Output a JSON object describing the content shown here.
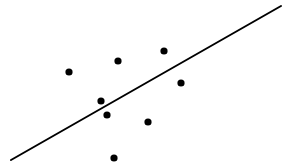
{
  "chart_data": {
    "type": "scatter",
    "title": "",
    "xlabel": "",
    "ylabel": "",
    "xlim": [
      0,
      293
    ],
    "ylim": [
      0,
      167
    ],
    "grid": false,
    "axes_visible": false,
    "legend": "none",
    "series": [
      {
        "name": "points",
        "color": "#000000",
        "points": [
          {
            "x": 69,
            "y": 95
          },
          {
            "x": 118,
            "y": 106
          },
          {
            "x": 164,
            "y": 116
          },
          {
            "x": 181,
            "y": 84
          },
          {
            "x": 101,
            "y": 66
          },
          {
            "x": 107,
            "y": 52
          },
          {
            "x": 148,
            "y": 45
          },
          {
            "x": 114,
            "y": 9
          }
        ]
      }
    ],
    "fit_line": {
      "name": "regression-line",
      "color": "#000000",
      "from": {
        "x": 11,
        "y": 7
      },
      "to": {
        "x": 281,
        "y": 161
      }
    }
  }
}
